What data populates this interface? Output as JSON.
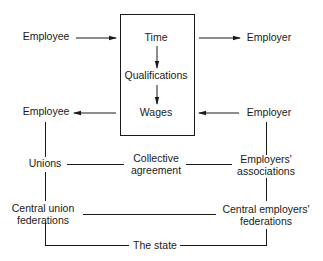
{
  "diagram": {
    "process_box": {
      "steps": [
        "Time",
        "Qualifications",
        "Wages"
      ]
    },
    "top_row": {
      "left": "Employee",
      "right": "Employer"
    },
    "bottom_row": {
      "left": "Employee",
      "right": "Employer"
    },
    "institutions": {
      "unions": "Unions",
      "collective_agreement_line1": "Collective",
      "collective_agreement_line2": "agreement",
      "employers_associations_line1": "Employers'",
      "employers_associations_line2": "associations",
      "central_union_line1": "Central union",
      "central_union_line2": "federations",
      "central_employers_line1": "Central employers'",
      "central_employers_line2": "federations",
      "state": "The state"
    },
    "colors": {
      "line": "#1a1a1a",
      "background": "#ffffff"
    }
  }
}
